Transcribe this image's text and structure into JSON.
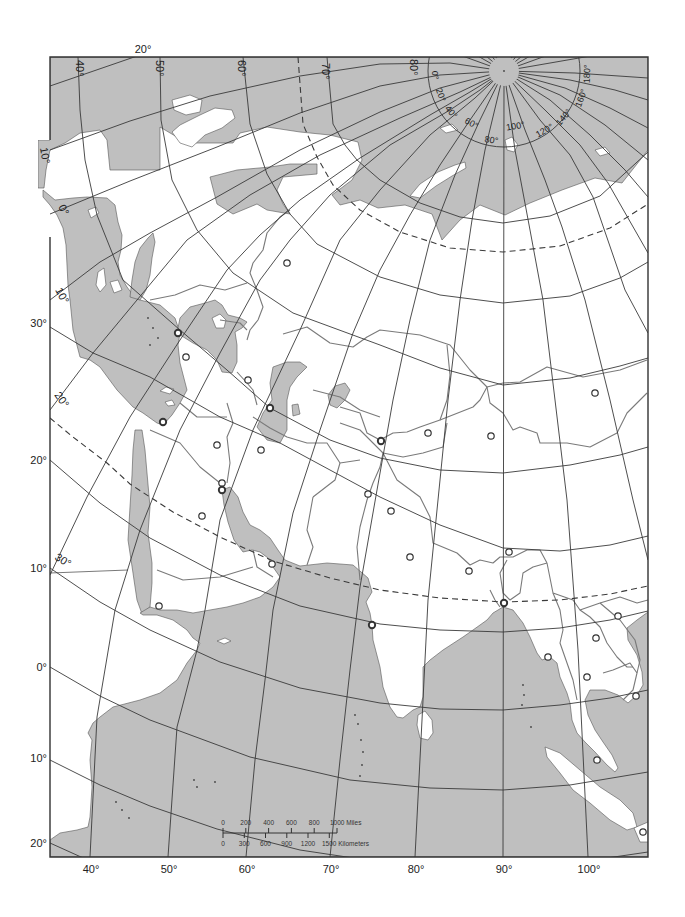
{
  "map": {
    "colors": {
      "sea": "#bfbfbf",
      "land": "#ffffff",
      "graticule": "#3a3a3a",
      "borders": "#7a7a7a",
      "frame": "#333333"
    }
  },
  "graticule_labels": {
    "top_meridian": "20°",
    "top_parallels": [
      "40°",
      "50°",
      "60°",
      "70°",
      "80°"
    ],
    "left_meridians": [
      "10°",
      "0°",
      "10°",
      "20°",
      "30°"
    ],
    "left_parallels": [
      "30°",
      "20°",
      "10°",
      "0°",
      "10°",
      "20°"
    ],
    "bottom_meridians": [
      "40°",
      "50°",
      "60°",
      "70°",
      "80°",
      "90°",
      "100°"
    ],
    "polar_meridians": [
      "0°",
      "20°",
      "40°",
      "60°",
      "80°",
      "100°",
      "120°",
      "140°",
      "160°",
      "180°"
    ]
  },
  "scale_bar": {
    "miles_labels": [
      "0",
      "200",
      "400",
      "600",
      "800",
      "1000 Miles"
    ],
    "kilometer_labels": [
      "0",
      "300",
      "600",
      "900",
      "1200",
      "1500 Kilometers"
    ]
  },
  "city_markers": [
    {
      "x": 287,
      "y": 263
    },
    {
      "x": 178,
      "y": 333,
      "bold": true
    },
    {
      "x": 186,
      "y": 357
    },
    {
      "x": 248,
      "y": 380
    },
    {
      "x": 270,
      "y": 408,
      "bold": true
    },
    {
      "x": 163,
      "y": 422,
      "bold": true
    },
    {
      "x": 217,
      "y": 445
    },
    {
      "x": 261,
      "y": 450
    },
    {
      "x": 222,
      "y": 483
    },
    {
      "x": 222,
      "y": 490,
      "bold": true
    },
    {
      "x": 202,
      "y": 516
    },
    {
      "x": 272,
      "y": 564
    },
    {
      "x": 159,
      "y": 606
    },
    {
      "x": 595,
      "y": 393
    },
    {
      "x": 381,
      "y": 441,
      "bold": true
    },
    {
      "x": 428,
      "y": 433
    },
    {
      "x": 491,
      "y": 436
    },
    {
      "x": 368,
      "y": 494
    },
    {
      "x": 391,
      "y": 511
    },
    {
      "x": 410,
      "y": 557
    },
    {
      "x": 469,
      "y": 571
    },
    {
      "x": 509,
      "y": 552
    },
    {
      "x": 504,
      "y": 603,
      "bold": true
    },
    {
      "x": 372,
      "y": 625,
      "bold": true
    },
    {
      "x": 548,
      "y": 657
    },
    {
      "x": 618,
      "y": 616
    },
    {
      "x": 596,
      "y": 638
    },
    {
      "x": 587,
      "y": 677
    },
    {
      "x": 636,
      "y": 696
    },
    {
      "x": 597,
      "y": 760
    },
    {
      "x": 643,
      "y": 832
    }
  ]
}
